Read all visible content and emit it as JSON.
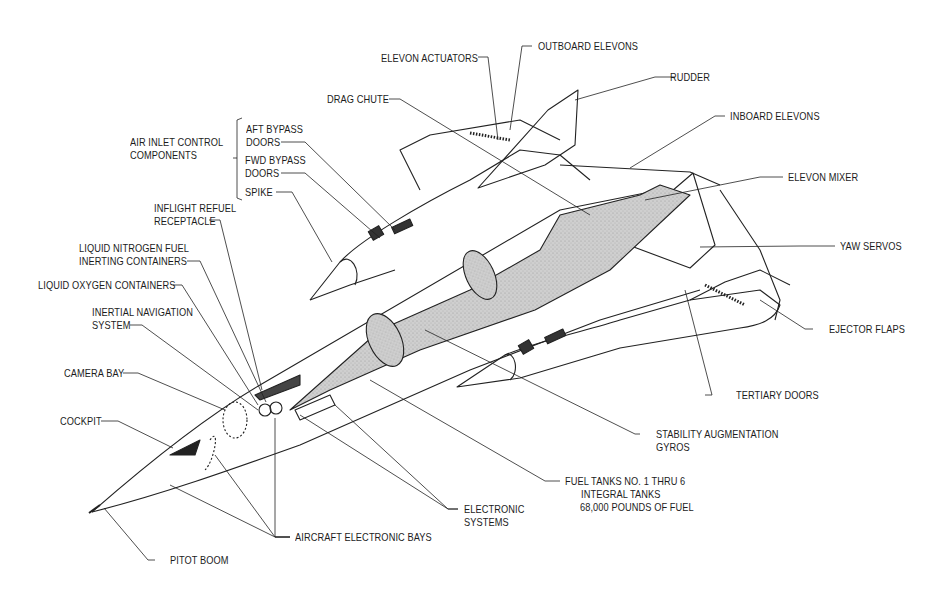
{
  "diagram": {
    "type": "aircraft-cutaway",
    "colors": {
      "line": "#222222",
      "fill_tank": "#c8c8c8",
      "fill_dark": "#333333",
      "background": "#ffffff"
    },
    "labels": {
      "elevon_actuators": "ELEVON ACTUATORS",
      "outboard_elevons": "OUTBOARD ELEVONS",
      "rudder": "RUDDER",
      "drag_chute": "DRAG CHUTE",
      "inboard_elevons": "INBOARD ELEVONS",
      "air_inlet_control_components": "AIR INLET CONTROL\nCOMPONENTS",
      "aft_bypass_doors": "AFT BYPASS\nDOORS",
      "fwd_bypass_doors": "FWD BYPASS\nDOORS",
      "spike": "SPIKE",
      "elevon_mixer": "ELEVON MIXER",
      "inflight_refuel_receptacle": "INFLIGHT REFUEL\nRECEPTACLE",
      "yaw_servos": "YAW SERVOS",
      "liquid_nitrogen": "LIQUID NITROGEN FUEL\nINERTING CONTAINERS",
      "liquid_oxygen": "LIQUID OXYGEN CONTAINERS",
      "ejector_flaps": "EJECTOR FLAPS",
      "inertial_navigation": "INERTIAL NAVIGATION\nSYSTEM",
      "camera_bay": "CAMERA BAY",
      "tertiary_doors": "TERTIARY DOORS",
      "cockpit": "COCKPIT",
      "stability_augmentation": "STABILITY AUGMENTATION\nGYROS",
      "fuel_tanks": "FUEL TANKS NO. 1 THRU 6",
      "integral_tanks": "INTEGRAL TANKS",
      "fuel_capacity": "68,000 POUNDS OF FUEL",
      "electronic_systems": "ELECTRONIC\nSYSTEMS",
      "aircraft_electronic_bays": "AIRCRAFT ELECTRONIC BAYS",
      "pitot_boom": "PITOT BOOM"
    }
  }
}
